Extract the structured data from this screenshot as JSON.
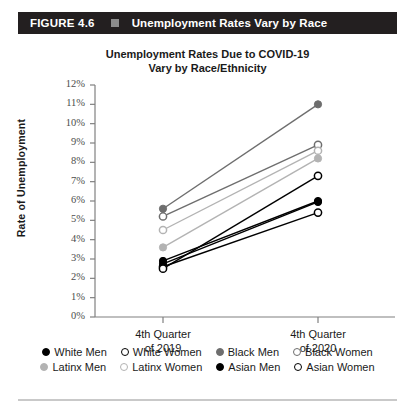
{
  "figure": {
    "number": "FIGURE 4.6",
    "separator_icon": "square-bullet-icon",
    "title": "Unemployment Rates Vary by Race"
  },
  "chart_data": {
    "type": "line",
    "title": "Unemployment Rates Due to COVID-19 Vary by Race/Ethnicity",
    "title_line1": "Unemployment Rates Due to COVID-19",
    "title_line2": "Vary by Race/Ethnicity",
    "xlabel": "",
    "ylabel": "Rate of Unemployment",
    "categories": [
      "4th Quarter of 2019",
      "4th Quarter of 2020"
    ],
    "category_lines": [
      [
        "4th Quarter",
        "of 2019"
      ],
      [
        "4th Quarter",
        "of 2020"
      ]
    ],
    "ylim": [
      0,
      12
    ],
    "ytick_labels": [
      "0%",
      "1%",
      "2%",
      "3%",
      "4%",
      "5%",
      "6%",
      "7%",
      "8%",
      "9%",
      "10%",
      "11%",
      "12%"
    ],
    "ytick_values": [
      0,
      1,
      2,
      3,
      4,
      5,
      6,
      7,
      8,
      9,
      10,
      11,
      12
    ],
    "grid": false,
    "legend_position": "bottom",
    "series": [
      {
        "name": "White Men",
        "values": [
          2.9,
          6.0
        ],
        "color": "#000000",
        "marker": "filled"
      },
      {
        "name": "White Women",
        "values": [
          2.6,
          5.4
        ],
        "color": "#000000",
        "marker": "open"
      },
      {
        "name": "Black Men",
        "values": [
          5.6,
          11.0
        ],
        "color": "#6e6e6e",
        "marker": "filled"
      },
      {
        "name": "Black Women",
        "values": [
          5.2,
          8.9
        ],
        "color": "#6e6e6e",
        "marker": "open"
      },
      {
        "name": "Latinx Men",
        "values": [
          3.6,
          8.2
        ],
        "color": "#b3b3b3",
        "marker": "filled"
      },
      {
        "name": "Latinx Women",
        "values": [
          4.5,
          8.6
        ],
        "color": "#b3b3b3",
        "marker": "open"
      },
      {
        "name": "Asian Men",
        "values": [
          2.75,
          5.95
        ],
        "color": "#000000",
        "marker": "filled"
      },
      {
        "name": "Asian Women",
        "values": [
          2.5,
          7.3
        ],
        "color": "#000000",
        "marker": "open"
      }
    ]
  },
  "colors": {
    "header_bg": "#231f20",
    "header_text": "#ffffff",
    "axis": "#808080",
    "dark": "#000000",
    "mid_gray": "#6e6e6e",
    "light_gray": "#b3b3b3"
  }
}
